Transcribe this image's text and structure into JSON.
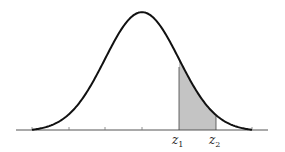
{
  "diagram": {
    "type": "normal-distribution-curve",
    "colors": {
      "curve": "#111111",
      "axis": "#555555",
      "shade": "#c4c4c4",
      "background": "#ffffff"
    },
    "labels": {
      "z1": {
        "base": "z",
        "sub": "1"
      },
      "z2": {
        "base": "z",
        "sub": "2"
      }
    },
    "axis": {
      "tick_positions_sigma": [
        -3,
        -2,
        -1,
        0,
        1,
        2,
        3
      ]
    },
    "shaded_region": {
      "from": "z1",
      "to": "z2",
      "from_sigma": 1,
      "to_sigma": 2
    }
  }
}
